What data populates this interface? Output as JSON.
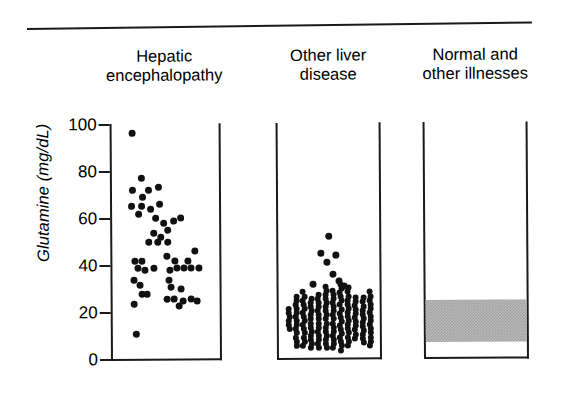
{
  "figure": {
    "y_axis_label": "Glutamine (mg/dL)",
    "y_ticks": [
      "100",
      "80",
      "60",
      "40",
      "20",
      "0"
    ]
  },
  "panels": [
    {
      "title_line1": "Hepatic",
      "title_line2": "encephalopathy"
    },
    {
      "title_line1": "Other liver",
      "title_line2": "disease"
    },
    {
      "title_line1": "Normal and",
      "title_line2": "other illnesses"
    }
  ],
  "chart_data": {
    "type": "scatter",
    "title": "",
    "xlabel": "",
    "ylabel": "Glutamine (mg/dL)",
    "ylim": [
      0,
      100
    ],
    "yticks": [
      0,
      20,
      40,
      60,
      80,
      100
    ],
    "grid": false,
    "legend": "none",
    "groups": [
      {
        "name": "Hepatic encephalopathy",
        "n": 48,
        "points": [
          {
            "jitter": 0.12,
            "value": 96
          },
          {
            "jitter": 0.22,
            "value": 77
          },
          {
            "jitter": 0.12,
            "value": 72
          },
          {
            "jitter": 0.3,
            "value": 72
          },
          {
            "jitter": 0.42,
            "value": 73
          },
          {
            "jitter": 0.24,
            "value": 69
          },
          {
            "jitter": 0.11,
            "value": 65
          },
          {
            "jitter": 0.23,
            "value": 65
          },
          {
            "jitter": 0.33,
            "value": 64
          },
          {
            "jitter": 0.43,
            "value": 66
          },
          {
            "jitter": 0.19,
            "value": 62
          },
          {
            "jitter": 0.38,
            "value": 60
          },
          {
            "jitter": 0.47,
            "value": 58
          },
          {
            "jitter": 0.58,
            "value": 59
          },
          {
            "jitter": 0.66,
            "value": 60
          },
          {
            "jitter": 0.52,
            "value": 55
          },
          {
            "jitter": 0.36,
            "value": 54
          },
          {
            "jitter": 0.44,
            "value": 52
          },
          {
            "jitter": 0.3,
            "value": 50
          },
          {
            "jitter": 0.4,
            "value": 50
          },
          {
            "jitter": 0.52,
            "value": 50
          },
          {
            "jitter": 0.82,
            "value": 46
          },
          {
            "jitter": 0.15,
            "value": 42
          },
          {
            "jitter": 0.22,
            "value": 42
          },
          {
            "jitter": 0.5,
            "value": 44
          },
          {
            "jitter": 0.6,
            "value": 42
          },
          {
            "jitter": 0.74,
            "value": 42
          },
          {
            "jitter": 0.18,
            "value": 39
          },
          {
            "jitter": 0.26,
            "value": 38
          },
          {
            "jitter": 0.36,
            "value": 39
          },
          {
            "jitter": 0.54,
            "value": 38
          },
          {
            "jitter": 0.62,
            "value": 39
          },
          {
            "jitter": 0.7,
            "value": 39
          },
          {
            "jitter": 0.78,
            "value": 39
          },
          {
            "jitter": 0.86,
            "value": 39
          },
          {
            "jitter": 0.13,
            "value": 34
          },
          {
            "jitter": 0.2,
            "value": 32
          },
          {
            "jitter": 0.53,
            "value": 34
          },
          {
            "jitter": 0.55,
            "value": 31
          },
          {
            "jitter": 0.66,
            "value": 30
          },
          {
            "jitter": 0.22,
            "value": 28
          },
          {
            "jitter": 0.28,
            "value": 28
          },
          {
            "jitter": 0.5,
            "value": 26
          },
          {
            "jitter": 0.58,
            "value": 26
          },
          {
            "jitter": 0.68,
            "value": 25
          },
          {
            "jitter": 0.78,
            "value": 26
          },
          {
            "jitter": 0.84,
            "value": 25
          },
          {
            "jitter": 0.14,
            "value": 24
          },
          {
            "jitter": 0.64,
            "value": 23
          },
          {
            "jitter": 0.16,
            "value": 11
          }
        ]
      },
      {
        "name": "Other liver disease",
        "n": 120,
        "note": "dense columnar cluster mostly between 5 and 30 mg/dL with several outliers up to 52 mg/dL",
        "outliers": [
          52,
          45,
          44,
          41,
          36,
          33,
          32,
          31
        ],
        "cluster_range": [
          4,
          30
        ]
      },
      {
        "name": "Normal and other illnesses",
        "n": 0,
        "note": "shown as shaded normal reference range band rather than individual points",
        "band_range": [
          7,
          25
        ]
      }
    ]
  }
}
